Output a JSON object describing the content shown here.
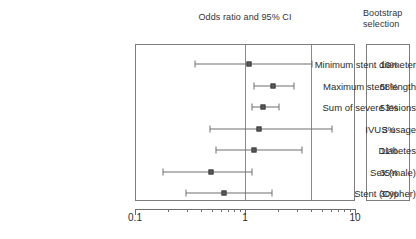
{
  "header": {
    "plot_title": "Odds ratio and 95% CI",
    "bootstrap_title_line1": "Bootstrap",
    "bootstrap_title_line2": "selection"
  },
  "axis": {
    "scale": "log10",
    "min": 0.1,
    "max": 10,
    "tick_labels": [
      "0.1",
      "1",
      "10"
    ],
    "tick_values": [
      0.1,
      1,
      10
    ],
    "reference_lines": [
      1,
      4
    ]
  },
  "chart_data": {
    "type": "scatter",
    "title": "Odds ratio and 95% CI",
    "xlabel": "",
    "ylabel": "",
    "xscale": "log",
    "xlim": [
      0.1,
      10
    ],
    "grid": false,
    "legend": "none",
    "reference_lines": [
      1,
      4
    ],
    "categories": [
      "Minimum stent diameter",
      "Maximum stent length",
      "Sum of severe lesions",
      "IVUS usage",
      "Diabetes",
      "Sex (male)",
      "Stent (Cypher)"
    ],
    "series": [
      {
        "name": "Odds ratio",
        "values": [
          1.08,
          1.8,
          1.45,
          1.35,
          1.2,
          0.49,
          0.65
        ]
      },
      {
        "name": "95% CI lower",
        "values": [
          0.35,
          1.2,
          1.15,
          0.48,
          0.55,
          0.18,
          0.29
        ]
      },
      {
        "name": "95% CI upper",
        "values": [
          4.1,
          2.8,
          2.05,
          6.2,
          3.3,
          1.15,
          1.75
        ]
      },
      {
        "name": "Bootstrap selection",
        "values": [
          16,
          58,
          53,
          3,
          11,
          35,
          30
        ]
      }
    ]
  },
  "rows": [
    {
      "label": "Minimum stent diameter",
      "or": 1.08,
      "lo": 0.35,
      "hi": 4.1,
      "pct": "16%"
    },
    {
      "label": "Maximum stent length",
      "or": 1.8,
      "lo": 1.2,
      "hi": 2.8,
      "pct": "58%"
    },
    {
      "label": "Sum of severe lesions",
      "or": 1.45,
      "lo": 1.15,
      "hi": 2.05,
      "pct": "53%"
    },
    {
      "label": "IVUS usage",
      "or": 1.35,
      "lo": 0.48,
      "hi": 6.2,
      "pct": "3%"
    },
    {
      "label": "Diabetes",
      "or": 1.2,
      "lo": 0.55,
      "hi": 3.3,
      "pct": "11%"
    },
    {
      "label": "Sex (male)",
      "or": 0.49,
      "lo": 0.18,
      "hi": 1.15,
      "pct": "35%"
    },
    {
      "label": "Stent (Cypher)",
      "or": 0.65,
      "lo": 0.29,
      "hi": 1.75,
      "pct": "30%"
    }
  ],
  "colors": {
    "frame": "#7d7d7d",
    "marker": "#5a5a5a",
    "line": "#6e6e6e",
    "text": "#2b2b2b",
    "background": "#ffffff"
  }
}
